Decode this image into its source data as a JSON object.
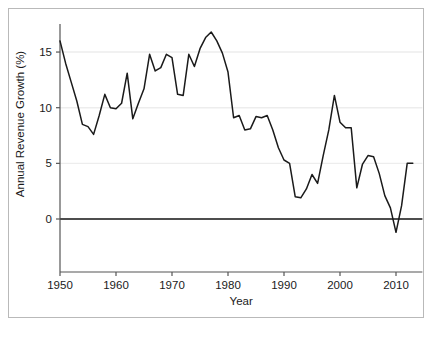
{
  "chart_data": {
    "type": "line",
    "title": "",
    "xlabel": "Year",
    "ylabel": "Annual Revenue Growth (%)",
    "xlim": [
      1950,
      2014
    ],
    "ylim": [
      -3.5,
      17.5
    ],
    "xticks": [
      1950,
      1960,
      1970,
      1980,
      1990,
      2000,
      2010
    ],
    "yticks": [
      0,
      5,
      10,
      15
    ],
    "xtick_labels": [
      "1950",
      "1960",
      "1970",
      "1980",
      "1990",
      "2000",
      "2010"
    ],
    "ytick_labels": [
      "0",
      "5",
      "10",
      "15"
    ],
    "grid": "horizontal-light",
    "legend": "none",
    "zero_line": 0,
    "line_color": "#1a1a1a",
    "grid_color": "#ededed",
    "zero_line_color": "#4d4d4d",
    "axis_color": "#555555",
    "frame_color": "#b9b9b9",
    "background": "#ffffff",
    "series": [
      {
        "name": "Annual Revenue Growth",
        "x": [
          1950,
          1951,
          1952,
          1953,
          1954,
          1955,
          1956,
          1957,
          1958,
          1959,
          1960,
          1961,
          1962,
          1963,
          1964,
          1965,
          1966,
          1967,
          1968,
          1969,
          1970,
          1971,
          1972,
          1973,
          1974,
          1975,
          1976,
          1977,
          1978,
          1979,
          1980,
          1981,
          1982,
          1983,
          1984,
          1985,
          1986,
          1987,
          1988,
          1989,
          1990,
          1991,
          1992,
          1993,
          1994,
          1995,
          1996,
          1997,
          1998,
          1999,
          2000,
          2001,
          2002,
          2003,
          2004,
          2005,
          2006,
          2007,
          2008,
          2009,
          2010,
          2011,
          2012,
          2013
        ],
        "values": [
          16.0,
          14.0,
          12.3,
          10.6,
          8.5,
          8.3,
          7.6,
          9.3,
          11.2,
          10.0,
          9.9,
          10.4,
          13.1,
          9.0,
          10.4,
          11.7,
          14.8,
          13.3,
          13.6,
          14.8,
          14.5,
          11.2,
          11.1,
          14.8,
          13.7,
          15.3,
          16.3,
          16.8,
          16.0,
          14.9,
          13.2,
          9.1,
          9.3,
          8.0,
          8.1,
          9.2,
          9.1,
          9.3,
          8.0,
          6.4,
          5.3,
          5.0,
          2.0,
          1.9,
          2.7,
          4.0,
          3.2,
          5.7,
          8.0,
          11.1,
          8.7,
          8.2,
          8.2,
          2.8,
          4.9,
          5.7,
          5.6,
          4.1,
          2.1,
          1.0,
          -1.2,
          1.2,
          5.0,
          5.0
        ]
      }
    ]
  },
  "figure": {
    "axis_bottom_label": "Year",
    "axis_left_label": "Annual Revenue Growth (%)"
  }
}
